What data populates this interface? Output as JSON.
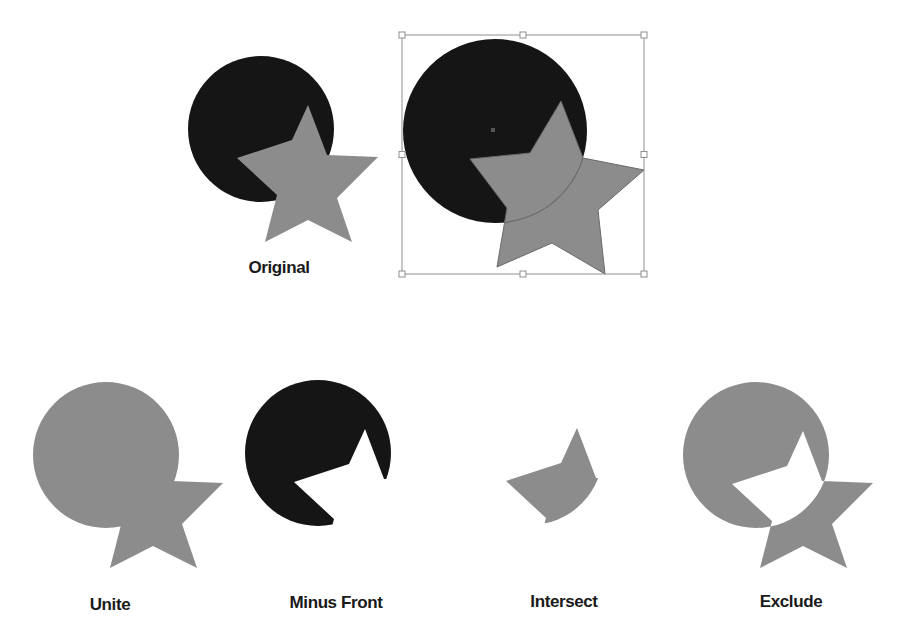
{
  "colors": {
    "background": "#ffffff",
    "circle_black": "#151515",
    "shape_gray": "#8c8c8c",
    "selection_stroke": "#8f8f8f",
    "outline_stroke": "#6a6a6a",
    "label_text": "#1a1a1a"
  },
  "base_shapes": {
    "circle": {
      "cx": 261,
      "cy": 129,
      "r": 73
    },
    "star_points": [
      [
        308,
        105
      ],
      [
        327,
        155
      ],
      [
        378,
        157
      ],
      [
        337,
        198
      ],
      [
        352,
        242
      ],
      [
        308,
        220
      ],
      [
        265,
        242
      ],
      [
        277,
        195
      ],
      [
        237,
        158
      ],
      [
        292,
        140
      ]
    ]
  },
  "figures": [
    {
      "id": "original",
      "label": "Original",
      "label_pos": [
        279,
        258
      ],
      "mode": "original",
      "offset": [
        0,
        0
      ]
    },
    {
      "id": "selected",
      "label": "",
      "mode": "selected",
      "circle": {
        "cx": 495,
        "cy": 131,
        "r": 92
      },
      "star_points": [
        [
          561,
          101
        ],
        [
          583,
          158
        ],
        [
          644,
          170
        ],
        [
          598,
          210
        ],
        [
          605,
          274
        ],
        [
          552,
          243
        ],
        [
          497,
          267
        ],
        [
          507,
          208
        ],
        [
          470,
          159
        ],
        [
          530,
          153
        ]
      ],
      "bounding_box": {
        "x": 402,
        "y": 35,
        "w": 242,
        "h": 239
      },
      "center_point": [
        493,
        130
      ]
    },
    {
      "id": "unite",
      "label": "Unite",
      "label_pos": [
        110,
        595
      ],
      "mode": "unite",
      "offset": [
        -155,
        326
      ]
    },
    {
      "id": "minus-front",
      "label": "Minus Front",
      "label_pos": [
        336,
        593
      ],
      "mode": "minus-front",
      "offset": [
        57,
        324
      ]
    },
    {
      "id": "intersect",
      "label": "Intersect",
      "label_pos": [
        564,
        592
      ],
      "mode": "intersect",
      "offset": [
        269,
        323
      ]
    },
    {
      "id": "exclude",
      "label": "Exclude",
      "label_pos": [
        791,
        592
      ],
      "mode": "exclude",
      "offset": [
        495,
        326
      ]
    }
  ]
}
